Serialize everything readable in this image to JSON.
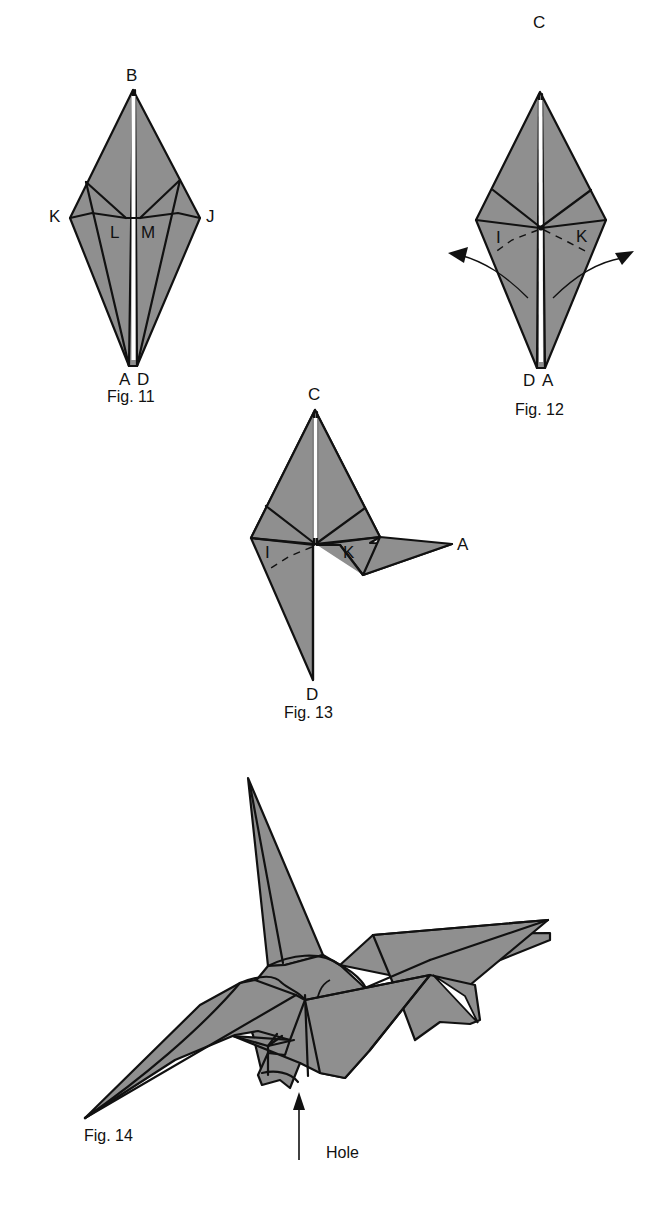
{
  "figures": [
    {
      "id": "fig11",
      "caption": "Fig. 11",
      "labels": {
        "top": "B",
        "left": "K",
        "right": "J",
        "inner_left": "L",
        "inner_right": "M",
        "bottom_left": "A",
        "bottom_right": "D"
      }
    },
    {
      "id": "fig12",
      "caption": "Fig. 12",
      "labels": {
        "top": "C",
        "inner_left": "I",
        "inner_right": "K",
        "bottom_left": "D",
        "bottom_right": "A"
      }
    },
    {
      "id": "fig13",
      "caption": "Fig. 13",
      "labels": {
        "top": "C",
        "inner_left": "I",
        "inner_right": "K",
        "right_tip": "A",
        "bottom": "D"
      }
    },
    {
      "id": "fig14",
      "caption": "Fig. 14",
      "annotation": "Hole"
    }
  ],
  "colors": {
    "paper": "#8f8f8f",
    "line": "#111111",
    "background": "#ffffff"
  }
}
